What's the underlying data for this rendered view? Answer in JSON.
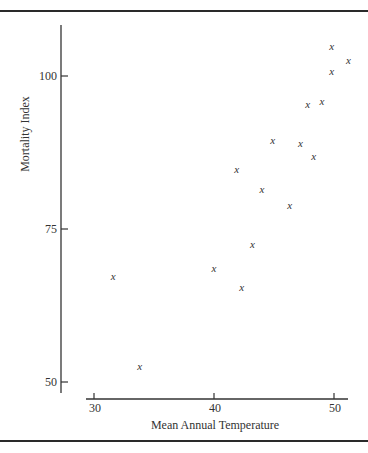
{
  "chart_data": {
    "type": "scatter",
    "title": "",
    "xlabel": "Mean Annual Temperature",
    "ylabel": "Mortality Index",
    "xlim": [
      29,
      51.5
    ],
    "ylim": [
      48,
      108
    ],
    "xticks": [
      30,
      40,
      50
    ],
    "yticks": [
      50,
      75,
      100
    ],
    "xtick_labels": [
      "30",
      "40",
      "50"
    ],
    "ytick_labels": [
      "50",
      "75",
      "100"
    ],
    "grid": false,
    "legend": null,
    "marker": "x",
    "points": [
      {
        "x": 49.8,
        "y": 104.9
      },
      {
        "x": 51.2,
        "y": 102.6
      },
      {
        "x": 49.8,
        "y": 100.7
      },
      {
        "x": 49.0,
        "y": 95.9
      },
      {
        "x": 47.8,
        "y": 95.3
      },
      {
        "x": 44.9,
        "y": 89.4
      },
      {
        "x": 47.2,
        "y": 88.9
      },
      {
        "x": 48.3,
        "y": 86.9
      },
      {
        "x": 41.9,
        "y": 84.8
      },
      {
        "x": 44.0,
        "y": 81.5
      },
      {
        "x": 46.3,
        "y": 78.8
      },
      {
        "x": 43.2,
        "y": 72.4
      },
      {
        "x": 40.0,
        "y": 68.5
      },
      {
        "x": 31.6,
        "y": 67.3
      },
      {
        "x": 42.3,
        "y": 65.5
      },
      {
        "x": 33.8,
        "y": 52.5
      }
    ]
  }
}
